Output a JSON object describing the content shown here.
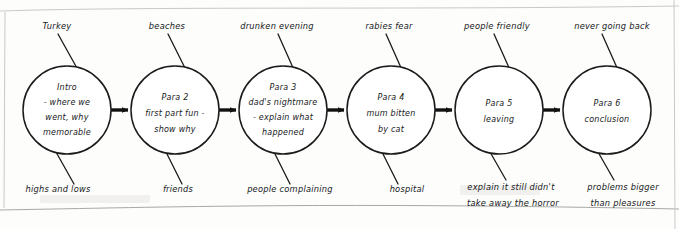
{
  "diagram": {
    "type": "flow-chain",
    "ink_color": "#16181a",
    "paper_color": "#fdfdfc",
    "nodes": [
      {
        "id": "node-1",
        "lines": [
          "Intro",
          "- where we",
          "went, why",
          "memorable"
        ],
        "top_label": "Turkey",
        "bottom_label": "highs and lows"
      },
      {
        "id": "node-2",
        "lines": [
          "Para 2",
          "first part fun -",
          "show why"
        ],
        "top_label": "beaches",
        "bottom_label": "friends"
      },
      {
        "id": "node-3",
        "lines": [
          "Para 3",
          "dad's nightmare",
          "- explain what",
          "happened"
        ],
        "top_label": "drunken evening",
        "bottom_label": "people complaining"
      },
      {
        "id": "node-4",
        "lines": [
          "Para 4",
          "mum bitten",
          "by cat"
        ],
        "top_label": "rabies fear",
        "bottom_label": "hospital"
      },
      {
        "id": "node-5",
        "lines": [
          "Para 5",
          "leaving"
        ],
        "top_label": "people friendly",
        "bottom_label_lines": [
          "explain it still didn't",
          "take away the horror"
        ]
      },
      {
        "id": "node-6",
        "lines": [
          "Para 6",
          "conclusion"
        ],
        "top_label": "never going back",
        "bottom_label_lines": [
          "problems bigger",
          "than pleasures"
        ]
      }
    ],
    "connectors": [
      {
        "from": "node-1",
        "to": "node-2",
        "style": "arrow-right"
      },
      {
        "from": "node-2",
        "to": "node-3",
        "style": "arrow-right"
      },
      {
        "from": "node-3",
        "to": "node-4",
        "style": "arrow-right"
      },
      {
        "from": "node-4",
        "to": "node-5",
        "style": "arrow-right"
      },
      {
        "from": "node-5",
        "to": "node-6",
        "style": "arrow-right"
      }
    ]
  }
}
